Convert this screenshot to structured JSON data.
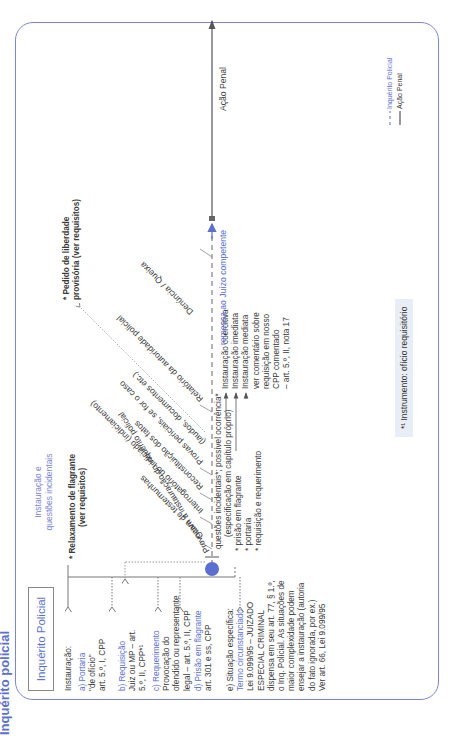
{
  "page_title": "Inquérito policial",
  "box_label": "Inquérito Policial",
  "section_heading": [
    "Instauração e",
    "questões incidentais"
  ],
  "instauracao": {
    "heading": "Instauração:",
    "items": [
      {
        "label": "a) Portaria",
        "lines": [
          "\"de ofício\"",
          "art. 5.º, I, CPP"
        ]
      },
      {
        "label": "b) Requisição",
        "lines": [
          "Juiz ou MP – art.",
          "5.º, II, CPP*¹"
        ]
      },
      {
        "label": "c) Requerimento",
        "lines": [
          "Provocação do",
          "ofendido ou representante",
          "legal – art. 5.º, II, CPP"
        ]
      },
      {
        "label": "d) Prisão em flagrante",
        "lines": [
          "art. 301 e ss, CPP"
        ]
      },
      {
        "label_prefix": "e) Situação específica:",
        "label": "Termo circunstanciado",
        "lines": [
          "Lei 9.099/95 – JUIZADO",
          "ESPECIAL CRIMINAL",
          "dispensa em seu art. 77, § 1.º,",
          "o Inq. Policial. As situações de",
          "maior complexidade podem",
          "ensejar a instauração (autoria",
          "do fato ignorada, por ex.)",
          "Ver art. 66, Lei 9.099/95"
        ]
      }
    ]
  },
  "relaxamento": [
    "* Relaxamento de flagrante",
    "(ver requisitos)"
  ],
  "liberdade": [
    "* Pedido de liberdade",
    "provisória (ver requisitos)"
  ],
  "provocam": "Provocam a instauração do inquérito policial",
  "diagonal_steps": [
    "Oitiva de testemunhas",
    "Interrogatório do indiciado (indiciamento)",
    "Reconstituição dos fatos",
    "Provas periciais, se for o caso",
    "(laudos, documentos etc.)",
    "Relatório da autoridade policial",
    "Denúncia / Queixa"
  ],
  "questoes": [
    "questões incidentais*; possível ocorrência*",
    "(especificação em capítulo próprio)"
  ],
  "instauracao_tipos": {
    "left": [
      "* prisão em flagrante",
      "* portaria",
      "* requisição e requerimento"
    ],
    "right": [
      "Instauração coercitiva",
      "Instauração imediata",
      "Instauração mediata"
    ],
    "comment": [
      "ver comentário sobre",
      "requisição em nosso",
      "CPP comentado",
      "– art. 5.º, II, nota 17"
    ]
  },
  "remessa": "remessa ao Juízo competente",
  "acao_penal": "Ação Penal",
  "instrumento": "*¹ Instrumento: ofício requisitório",
  "legend": [
    {
      "style": "dashed",
      "label": "Inquérito Policial",
      "color": "#5b6fd1"
    },
    {
      "style": "solid",
      "label": "Ação Penal",
      "color": "#333333"
    }
  ],
  "colors": {
    "accent": "#5b6fd1",
    "frame": "#7b86d4",
    "text": "#3a3a3a"
  }
}
